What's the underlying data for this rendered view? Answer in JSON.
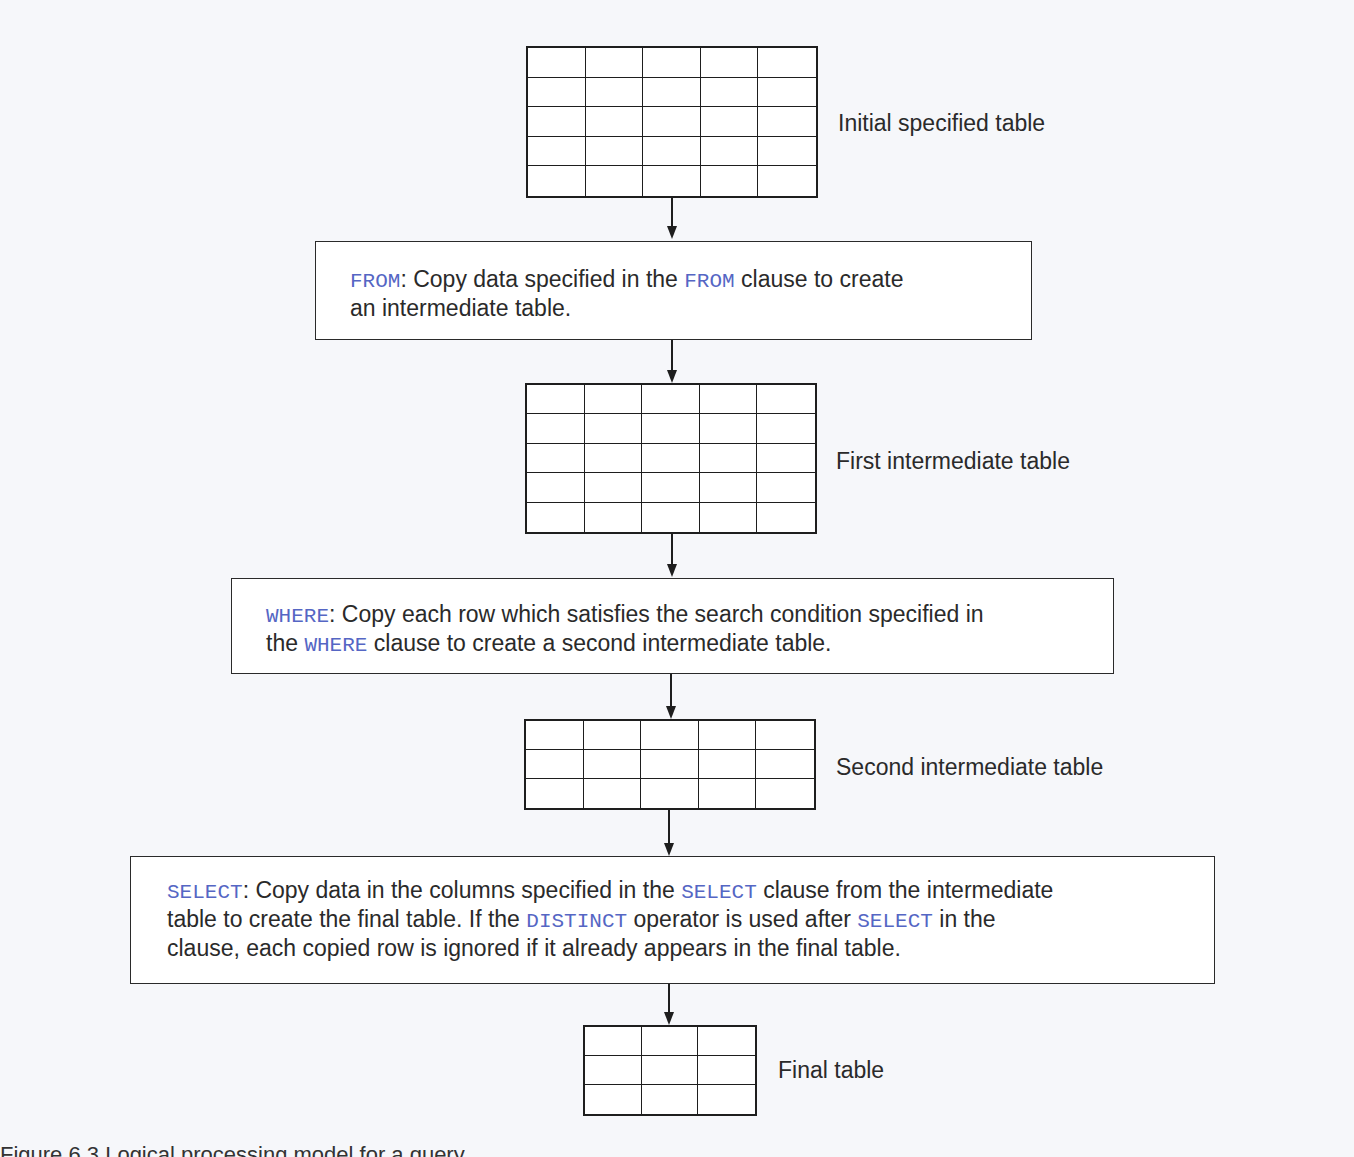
{
  "tables": [
    {
      "label": "Initial specified table",
      "rows": 5,
      "cols": 5
    },
    {
      "label": "First intermediate table",
      "rows": 5,
      "cols": 5
    },
    {
      "label": "Second intermediate table",
      "rows": 3,
      "cols": 5
    },
    {
      "label": "Final table",
      "rows": 3,
      "cols": 3
    }
  ],
  "steps": {
    "from": {
      "keyword": "FROM",
      "text_1": ": Copy data specified in the ",
      "keyword_2": "FROM",
      "text_2": " clause to create",
      "text_3": "an intermediate table."
    },
    "where": {
      "keyword": "WHERE",
      "text_1": ": Copy each row which satisfies the search condition specified in",
      "text_2": "the ",
      "keyword_2": "WHERE",
      "text_3": " clause to create a second intermediate table."
    },
    "select": {
      "keyword": "SELECT",
      "text_1": ": Copy data in the columns specified in the ",
      "keyword_2": "SELECT",
      "text_2": " clause from the intermediate",
      "text_3": "table to create the final table. If the ",
      "keyword_3": "DISTINCT",
      "text_4": " operator is used after ",
      "keyword_4": "SELECT",
      "text_5": " in the",
      "text_6": "clause, each copied row is ignored if it already appears in the final table."
    }
  },
  "caption": "Figure 6.3   Logical processing model for a query",
  "colors": {
    "keyword": "#5566c4",
    "line": "#1e1e1e"
  }
}
